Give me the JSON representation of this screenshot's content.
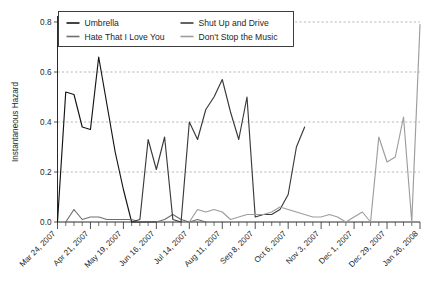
{
  "chart_data": {
    "type": "line",
    "title": "",
    "xlabel": "",
    "ylabel": "Instantaneous Hazard",
    "ylim": [
      0.0,
      0.8
    ],
    "yticks": [
      0.0,
      0.2,
      0.4,
      0.6,
      0.8
    ],
    "ytick_labels": [
      "0.0",
      "0.2",
      "0.4",
      "0.6",
      "0.8"
    ],
    "grid": true,
    "grid_axis": "y",
    "legend_position": "top-left-inside",
    "x_unit": "week",
    "x_start": "Mar 24, 2007",
    "x_end": "Jan 26, 2008",
    "x_major_tick_interval_weeks": 4,
    "x_minor_tick_interval_weeks": 1,
    "xtick_labels": [
      "Mar 24, 2007",
      "Apr 21, 2007",
      "May 19, 2007",
      "Jun 16, 2007",
      "Jul 14, 2007",
      "Aug 11, 2007",
      "Sep 8, 2007",
      "Oct 6, 2007",
      "Nov 3, 2007",
      "Dec 1, 2007",
      "Dec 29, 2007",
      "Jan 26, 2008"
    ],
    "xtick_positions_weeks": [
      0,
      4,
      8,
      12,
      16,
      20,
      24,
      28,
      32,
      36,
      40,
      44
    ],
    "series": [
      {
        "name": "Umbrella",
        "color": "#141414",
        "x": [
          0,
          1,
          2,
          3,
          4,
          5,
          6,
          7,
          8,
          9,
          10,
          11,
          12
        ],
        "values": [
          0.0,
          0.52,
          0.51,
          0.38,
          0.37,
          0.66,
          0.47,
          0.28,
          0.13,
          0.0,
          0.0,
          0.0,
          0.0
        ]
      },
      {
        "name": "Hate That I Love You",
        "color": "#6e6e6e",
        "x": [
          1,
          2,
          3,
          4,
          5,
          6,
          7,
          8,
          9,
          10,
          11,
          12,
          13,
          14,
          15,
          16,
          17,
          18
        ],
        "values": [
          0.0,
          0.05,
          0.01,
          0.02,
          0.02,
          0.01,
          0.01,
          0.01,
          0.01,
          0.0,
          0.0,
          0.0,
          0.01,
          0.03,
          0.01,
          0.0,
          0.01,
          0.0
        ]
      },
      {
        "name": "Shut Up and Drive",
        "color": "#3a3a3a",
        "x": [
          9,
          10,
          11,
          12,
          13,
          14,
          15,
          16,
          17,
          18,
          19,
          20,
          21,
          22,
          23,
          24,
          25,
          26,
          27,
          28,
          29,
          30
        ],
        "values": [
          0.0,
          0.01,
          0.33,
          0.21,
          0.34,
          0.01,
          0.0,
          0.4,
          0.33,
          0.45,
          0.5,
          0.57,
          0.44,
          0.33,
          0.5,
          0.02,
          0.03,
          0.03,
          0.05,
          0.11,
          0.3,
          0.38
        ]
      },
      {
        "name": "Don't Stop the Music",
        "color": "#9d9d9d",
        "x": [
          16,
          17,
          18,
          19,
          20,
          21,
          22,
          23,
          24,
          25,
          26,
          27,
          28,
          29,
          30,
          31,
          32,
          33,
          34,
          35,
          36,
          37,
          38,
          39,
          40,
          41,
          42,
          43,
          44
        ],
        "values": [
          0.0,
          0.05,
          0.04,
          0.05,
          0.04,
          0.01,
          0.02,
          0.03,
          0.03,
          0.03,
          0.04,
          0.06,
          0.05,
          0.04,
          0.03,
          0.02,
          0.02,
          0.03,
          0.02,
          0.0,
          0.02,
          0.04,
          0.0,
          0.34,
          0.24,
          0.26,
          0.42,
          0.0,
          0.79
        ]
      }
    ]
  },
  "legend": {
    "entries": [
      {
        "label": "Umbrella",
        "color": "#141414"
      },
      {
        "label": "Shut Up and Drive",
        "color": "#3a3a3a"
      },
      {
        "label": "Hate That I Love You",
        "color": "#6e6e6e"
      },
      {
        "label": "Don't Stop the Music",
        "color": "#9d9d9d"
      }
    ]
  },
  "axes": {
    "y_title": "Instantaneous Hazard"
  }
}
